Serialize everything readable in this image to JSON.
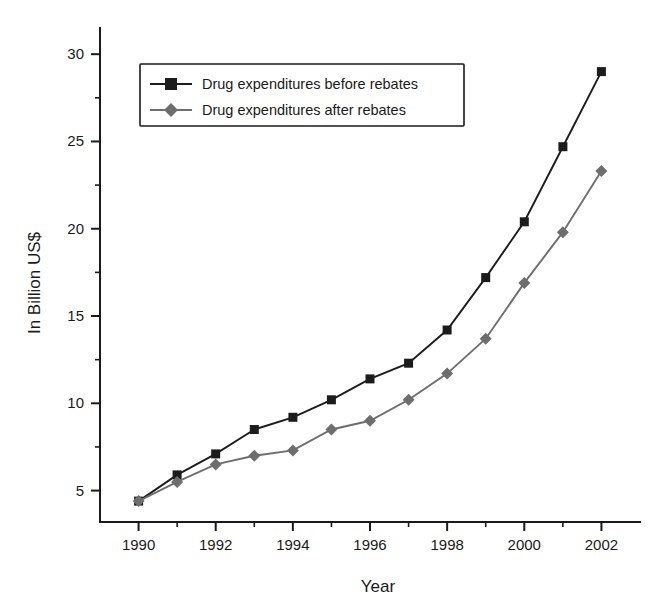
{
  "chart_data": {
    "type": "line",
    "title": "",
    "xlabel": "Year",
    "ylabel": "In Billion US$",
    "x": [
      1990,
      1991,
      1992,
      1993,
      1994,
      1995,
      1996,
      1997,
      1998,
      1999,
      2000,
      2001,
      2002
    ],
    "xlim": [
      1989,
      2003
    ],
    "ylim": [
      3.2,
      31.5
    ],
    "grid": false,
    "legend_position": "top-left-inside",
    "x_tick_labels": [
      "1990",
      "1992",
      "1994",
      "1996",
      "1998",
      "2000",
      "2002"
    ],
    "x_ticks_major": [
      1990,
      1992,
      1994,
      1996,
      1998,
      2000,
      2002
    ],
    "x_ticks_minor": [
      1991,
      1993,
      1995,
      1997,
      1999,
      2001
    ],
    "y_tick_labels": [
      "5",
      "10",
      "15",
      "20",
      "25",
      "30"
    ],
    "y_ticks_major": [
      5,
      10,
      15,
      20,
      25,
      30
    ],
    "y_ticks_minor": [
      7.5,
      12.5,
      17.5,
      22.5,
      27.5
    ],
    "series": [
      {
        "name": "Drug expenditures before rebates",
        "marker": "square",
        "color": "#1c1c1c",
        "values": [
          4.4,
          5.9,
          7.1,
          8.5,
          9.2,
          10.2,
          11.4,
          12.3,
          14.2,
          17.2,
          20.4,
          24.7,
          29.0
        ]
      },
      {
        "name": "Drug expenditures after rebates",
        "marker": "diamond",
        "color": "#6e6e6e",
        "values": [
          4.4,
          5.5,
          6.5,
          7.0,
          7.3,
          8.5,
          9.0,
          10.2,
          11.7,
          13.7,
          16.9,
          19.8,
          23.3
        ]
      }
    ]
  },
  "legend": {
    "items": [
      {
        "label": "Drug expenditures before rebates"
      },
      {
        "label": "Drug expenditures after rebates"
      }
    ]
  },
  "axes": {
    "x_title": "Year",
    "y_title": "In Billion US$"
  }
}
